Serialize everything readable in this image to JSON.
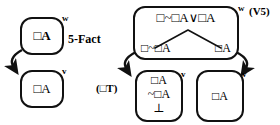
{
  "diagram": {
    "ink_color": "#111111",
    "background": "#ffffff"
  },
  "left_group": {
    "rule_label": "5-Fact",
    "world_w": {
      "label": "w",
      "formulas": [
        "□A"
      ]
    },
    "world_v": {
      "label": "v",
      "formulas": [
        "□A"
      ]
    },
    "accessibility_arrow": "arrow-w-to-v"
  },
  "right_group": {
    "rule_label_top": "(V5)",
    "rule_label_left": "(□T)",
    "world_w": {
      "label": "w",
      "formulas": [
        "□~□A∨□A"
      ],
      "branch_left": "□~□A",
      "branch_right": "□A"
    },
    "world_v_middle": {
      "label": "v",
      "formulas": [
        "□A",
        "~□A",
        "⊥"
      ]
    },
    "world_v_right": {
      "label": "v",
      "formulas": [
        "□A"
      ]
    },
    "accessibility_arrows": [
      "arrow-w-to-v-left",
      "arrow-w-to-v-right"
    ]
  }
}
